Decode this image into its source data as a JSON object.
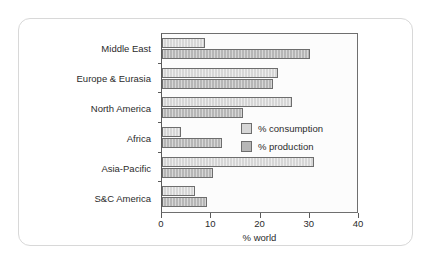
{
  "chart_data": {
    "type": "bar",
    "orientation": "horizontal",
    "title": "",
    "xlabel": "% world",
    "ylabel": "",
    "xlim": [
      0,
      40
    ],
    "xticks": [
      0,
      10,
      20,
      30,
      40
    ],
    "xtick_labels": [
      "0",
      "10",
      "20",
      "30",
      "40"
    ],
    "grid": false,
    "legend_position": "inside-right",
    "categories": [
      "Middle East",
      "Europe & Eurasia",
      "North America",
      "Africa",
      "Asia-Pacific",
      "S&C America"
    ],
    "series": [
      {
        "name": "% consumption",
        "color": "#d6d6d6",
        "values": [
          8.8,
          23.7,
          26.6,
          3.9,
          31.2,
          6.8
        ]
      },
      {
        "name": "% production",
        "color": "#b6b6b6",
        "values": [
          30.4,
          22.7,
          16.7,
          12.3,
          10.4,
          9.3
        ]
      }
    ]
  },
  "legend": {
    "items": [
      {
        "label": "% consumption"
      },
      {
        "label": "% production"
      }
    ]
  },
  "colors": {
    "consumption": "#d6d6d6",
    "production": "#b6b6b6",
    "axis": "#5a5a5a",
    "plot_background": "#fcfcfc",
    "card_border": "#d8d8d8"
  }
}
